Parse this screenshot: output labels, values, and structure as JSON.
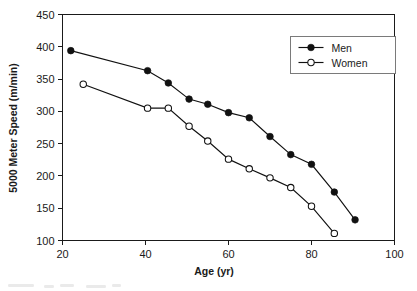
{
  "chart_data": {
    "type": "line",
    "title": "",
    "xlabel": "Age (yr)",
    "ylabel": "5000 Meter Speed (m/min)",
    "xlim": [
      20,
      100
    ],
    "ylim": [
      100,
      450
    ],
    "xticks": [
      20,
      40,
      60,
      80,
      100
    ],
    "yticks": [
      100,
      150,
      200,
      250,
      300,
      350,
      400,
      450
    ],
    "xtick_labels": [
      "20",
      "40",
      "60",
      "80",
      "100"
    ],
    "ytick_labels": [
      "100",
      "150",
      "200",
      "250",
      "300",
      "350",
      "400",
      "450"
    ],
    "grid": false,
    "legend_position": "upper right",
    "series": [
      {
        "name": "Men",
        "marker": "filled-circle",
        "color": "#111111",
        "x": [
          22,
          40.5,
          45.5,
          50.5,
          55,
          60,
          65,
          70,
          75,
          80,
          85.5,
          90.5
        ],
        "y": [
          394,
          363,
          344,
          319,
          311,
          298,
          290,
          261,
          233,
          218,
          175,
          132
        ]
      },
      {
        "name": "Women",
        "marker": "open-circle",
        "color": "#111111",
        "x": [
          25,
          40.5,
          45.5,
          50.5,
          55,
          60,
          65,
          70,
          75,
          80,
          85.5
        ],
        "y": [
          342,
          305,
          305,
          277,
          254,
          226,
          211,
          197,
          182,
          153,
          111
        ]
      }
    ]
  },
  "legend": {
    "entries": [
      {
        "label": "Men",
        "marker": "filled-circle"
      },
      {
        "label": "Women",
        "marker": "open-circle"
      }
    ]
  },
  "axes": {
    "x_title": "Age (yr)",
    "y_title": "5000 Meter Speed (m/min)"
  }
}
